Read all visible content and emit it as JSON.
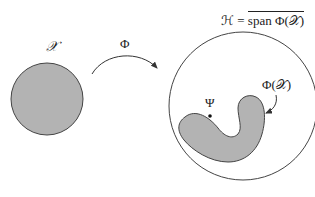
{
  "figure": {
    "type": "feature-map-diagram",
    "input_space": {
      "label": "𝒳",
      "shape": "filled circle",
      "fill": "#b3b3b3",
      "stroke": "#444444"
    },
    "mapping": {
      "label": "Φ",
      "arrow": "curved, from input space to feature space"
    },
    "feature_space": {
      "label_lhs": "ℋ = ",
      "label_rhs": "span Φ(𝒳)",
      "shape": "large unfilled circle",
      "stroke": "#444444"
    },
    "image_of_input": {
      "label": "Φ(𝒳)",
      "shape": "kidney/bean-shaped filled region",
      "fill": "#b3b3b3"
    },
    "point": {
      "label": "Ψ",
      "marker": "dot"
    }
  },
  "colors": {
    "background": "#ffffff",
    "stroke": "#444444",
    "fill": "#b3b3b3",
    "text": "#222222"
  }
}
